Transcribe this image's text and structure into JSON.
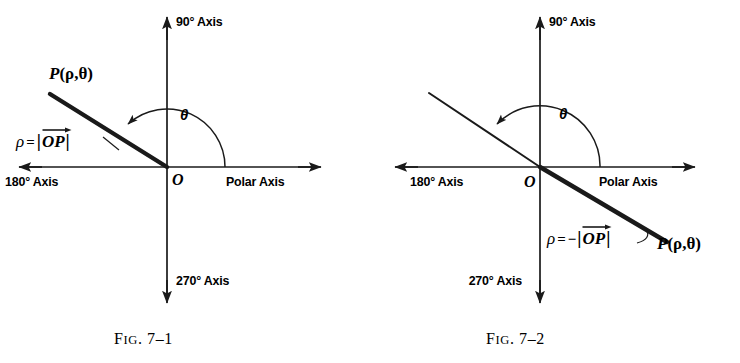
{
  "page": {
    "background": "#ffffff",
    "ink": "#1a1a1a",
    "width": 740,
    "height": 363
  },
  "figures": [
    {
      "id": "fig-7-1",
      "caption_prefix": "F",
      "caption_smallcaps": "IG",
      "caption_rest": ". 7–1",
      "caption_full": "FIG. 7–1",
      "axes": {
        "vertical_up": "90° Axis",
        "vertical_down": "270° Axis",
        "horizontal_right": "Polar Axis",
        "horizontal_left": "180° Axis"
      },
      "origin_label": "O",
      "angle_label": "θ",
      "point_label_P": "P",
      "point_label_args": "(ρ,θ)",
      "point_label_full": "P(ρ,θ)",
      "rho_symbol": "ρ",
      "rho_equals": "=",
      "rho_sign": "",
      "rho_bar": "|",
      "rho_vector": "OP",
      "rho_expression": "ρ = |OP|",
      "ray_description": "thick ray from origin into second quadrant",
      "rho_sign_meaning": "positive"
    },
    {
      "id": "fig-7-2",
      "caption_prefix": "F",
      "caption_smallcaps": "IG",
      "caption_rest": ". 7–2",
      "caption_full": "FIG. 7–2",
      "axes": {
        "vertical_up": "90° Axis",
        "vertical_down": "270° Axis",
        "horizontal_right": "Polar Axis",
        "horizontal_left": "180° Axis"
      },
      "origin_label": "O",
      "angle_label": "θ",
      "point_label_P": "P",
      "point_label_args": "(ρ,θ)",
      "point_label_full": "P(ρ,θ)",
      "rho_symbol": "ρ",
      "rho_equals": "=",
      "rho_sign": "−",
      "rho_bar": "|",
      "rho_vector": "OP",
      "rho_expression": "ρ = −|OP|",
      "ray_description": "thin line into second quadrant, thick segment into fourth quadrant",
      "rho_sign_meaning": "negative"
    }
  ]
}
